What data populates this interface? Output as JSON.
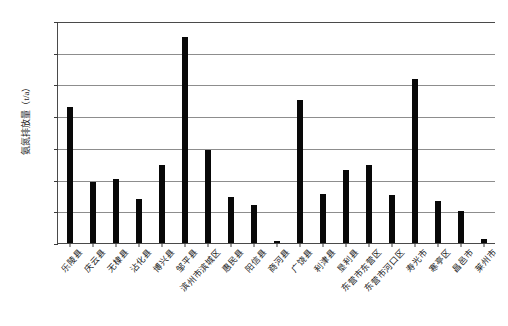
{
  "chart_data": {
    "type": "bar",
    "title": "",
    "subtitle": "",
    "xlabel": "",
    "ylabel": "氨氮排放量（t/a）",
    "ylim": [
      0,
      1400
    ],
    "ytick_step": 200,
    "grid": true,
    "legend": "none",
    "bar_color": "#080808",
    "grid_color": "#8d8d8d",
    "axis_color": "#4a4a4a",
    "ytick_labels": [
      "0",
      "200",
      "400",
      "600",
      "800",
      "1 000",
      "1 200",
      "1 400"
    ],
    "ytick_values": [
      0,
      200,
      400,
      600,
      800,
      1000,
      1200,
      1400
    ],
    "categories": [
      "乐陵县",
      "庆云县",
      "无棣县",
      "沾化县",
      "博兴县",
      "邹平县",
      "滨州市滨城区",
      "惠民县",
      "阳信县",
      "商河县",
      "广饶县",
      "利津县",
      "垦利县",
      "东营市东营区",
      "东营市河口区",
      "寿光市",
      "寒亭区",
      "昌邑市",
      "莱州市"
    ],
    "values": [
      860,
      385,
      405,
      280,
      490,
      1300,
      585,
      290,
      240,
      10,
      905,
      310,
      460,
      490,
      300,
      1035,
      265,
      200,
      25
    ]
  }
}
